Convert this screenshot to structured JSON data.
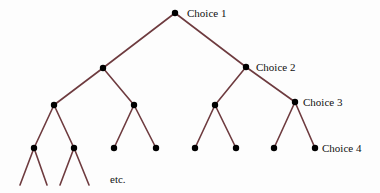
{
  "diagram": {
    "type": "decision-tree",
    "colors": {
      "edge": "#6e3b3f",
      "node": "#000000",
      "text": "#111111"
    },
    "labels": {
      "choice1": "Choice 1",
      "choice2": "Choice 2",
      "choice3": "Choice 3",
      "choice4": "Choice 4",
      "etc": "etc."
    },
    "nodes": [
      {
        "id": "root",
        "x": 175,
        "y": 13,
        "label": "Choice 1"
      },
      {
        "id": "L",
        "x": 103,
        "y": 68
      },
      {
        "id": "R",
        "x": 246,
        "y": 67,
        "label": "Choice 2"
      },
      {
        "id": "LL",
        "x": 54,
        "y": 105
      },
      {
        "id": "LR",
        "x": 134,
        "y": 105
      },
      {
        "id": "RL",
        "x": 215,
        "y": 105
      },
      {
        "id": "RR",
        "x": 295,
        "y": 102,
        "label": "Choice 3"
      },
      {
        "id": "LLL",
        "x": 34,
        "y": 148
      },
      {
        "id": "LLR",
        "x": 74,
        "y": 148
      },
      {
        "id": "LRL",
        "x": 114,
        "y": 148
      },
      {
        "id": "LRR",
        "x": 156,
        "y": 148
      },
      {
        "id": "RLL",
        "x": 195,
        "y": 148
      },
      {
        "id": "RLR",
        "x": 236,
        "y": 148
      },
      {
        "id": "RRL",
        "x": 274,
        "y": 148
      },
      {
        "id": "RRR",
        "x": 315,
        "y": 148,
        "label": "Choice 4"
      }
    ],
    "edges": [
      [
        "root",
        "L"
      ],
      [
        "root",
        "R"
      ],
      [
        "L",
        "LL"
      ],
      [
        "L",
        "LR"
      ],
      [
        "R",
        "RL"
      ],
      [
        "R",
        "RR"
      ],
      [
        "LL",
        "LLL"
      ],
      [
        "LL",
        "LLR"
      ],
      [
        "LR",
        "LRL"
      ],
      [
        "LR",
        "LRR"
      ],
      [
        "RL",
        "RLL"
      ],
      [
        "RL",
        "RLR"
      ],
      [
        "RR",
        "RRL"
      ],
      [
        "RR",
        "RRR"
      ]
    ],
    "open_branches": [
      {
        "from": "LLL",
        "to_x": 20,
        "to_y": 185
      },
      {
        "from": "LLL",
        "to_x": 47,
        "to_y": 185
      },
      {
        "from": "LLR",
        "to_x": 60,
        "to_y": 185
      },
      {
        "from": "LLR",
        "to_x": 89,
        "to_y": 185
      }
    ]
  }
}
